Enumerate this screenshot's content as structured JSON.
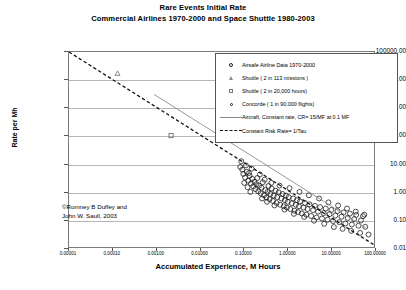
{
  "chart_data": {
    "type": "scatter",
    "title": "Rare Events Initial Rate",
    "subtitle": "Commercial Airlines 1970-2000 and Space Shuttle 1980-2003",
    "xlabel": "Accumulated Experience, M Hours",
    "ylabel": "Rate per Mh",
    "xscale": "log",
    "yscale": "log",
    "xlim": [
      1e-05,
      100.0
    ],
    "ylim": [
      0.01,
      100000.0
    ],
    "grid": "horizontal",
    "legend_position": "top-right",
    "xticks": [
      "0.00001",
      "0.00010",
      "0.00100",
      "0.01000",
      "0.10000",
      "1.00000",
      "10.00000",
      "100.00000"
    ],
    "xtick_values": [
      1e-05,
      0.0001,
      0.001,
      0.01,
      0.1,
      1,
      10,
      100
    ],
    "yticks": [
      "100000.00",
      "10000.00",
      "1000.00",
      "100.00",
      "10.00",
      "1.00",
      "0.10",
      "0.01"
    ],
    "ytick_values": [
      100000,
      10000,
      1000,
      100,
      10,
      1,
      0.1,
      0.01
    ],
    "credit": [
      "©Romney B Duffey and",
      "John W. Saull, 2003"
    ],
    "series": [
      {
        "name": "Airsafe Airline Data 1970-2000",
        "marker": "open-circle",
        "type": "scatter",
        "points": [
          [
            0.085,
            7.5
          ],
          [
            0.1,
            4.2
          ],
          [
            0.11,
            3.1
          ],
          [
            0.12,
            5.0
          ],
          [
            0.13,
            2.4
          ],
          [
            0.14,
            3.6
          ],
          [
            0.15,
            1.9
          ],
          [
            0.16,
            2.8
          ],
          [
            0.17,
            1.5
          ],
          [
            0.18,
            2.2
          ],
          [
            0.19,
            1.2
          ],
          [
            0.2,
            1.8
          ],
          [
            0.21,
            3.0
          ],
          [
            0.22,
            1.0
          ],
          [
            0.23,
            1.6
          ],
          [
            0.25,
            0.85
          ],
          [
            0.26,
            1.35
          ],
          [
            0.28,
            2.1
          ],
          [
            0.3,
            0.72
          ],
          [
            0.32,
            1.1
          ],
          [
            0.34,
            0.6
          ],
          [
            0.36,
            0.95
          ],
          [
            0.38,
            1.55
          ],
          [
            0.4,
            0.52
          ],
          [
            0.42,
            0.8
          ],
          [
            0.45,
            1.25
          ],
          [
            0.48,
            0.45
          ],
          [
            0.5,
            0.7
          ],
          [
            0.55,
            1.05
          ],
          [
            0.58,
            0.38
          ],
          [
            0.6,
            0.62
          ],
          [
            0.65,
            0.92
          ],
          [
            0.7,
            0.33
          ],
          [
            0.75,
            0.55
          ],
          [
            0.8,
            0.8
          ],
          [
            0.85,
            0.29
          ],
          [
            0.9,
            0.48
          ],
          [
            0.95,
            0.7
          ],
          [
            1.0,
            0.26
          ],
          [
            1.05,
            0.42
          ],
          [
            1.1,
            0.62
          ],
          [
            1.2,
            0.23
          ],
          [
            1.3,
            0.37
          ],
          [
            1.4,
            0.55
          ],
          [
            1.5,
            0.2
          ],
          [
            1.6,
            0.33
          ],
          [
            1.7,
            0.48
          ],
          [
            1.8,
            0.18
          ],
          [
            1.9,
            0.29
          ],
          [
            2.0,
            0.43
          ],
          [
            2.2,
            0.16
          ],
          [
            2.4,
            0.26
          ],
          [
            2.6,
            0.38
          ],
          [
            2.8,
            0.145
          ],
          [
            3.0,
            0.23
          ],
          [
            3.3,
            0.34
          ],
          [
            3.6,
            0.13
          ],
          [
            4.0,
            0.21
          ],
          [
            4.4,
            0.3
          ],
          [
            4.8,
            0.115
          ],
          [
            5.2,
            0.185
          ],
          [
            5.8,
            0.27
          ],
          [
            6.4,
            0.105
          ],
          [
            7.0,
            0.165
          ],
          [
            7.8,
            0.24
          ],
          [
            8.6,
            0.095
          ],
          [
            9.5,
            0.15
          ],
          [
            10.5,
            0.215
          ],
          [
            11.5,
            0.085
          ],
          [
            13.0,
            0.135
          ],
          [
            14.5,
            0.195
          ],
          [
            16.0,
            0.078
          ],
          [
            18.0,
            0.122
          ],
          [
            20.0,
            0.175
          ],
          [
            22.0,
            0.07
          ],
          [
            25.0,
            0.11
          ],
          [
            28.0,
            0.158
          ],
          [
            31.0,
            0.064
          ],
          [
            35.0,
            0.1
          ],
          [
            39.0,
            0.142
          ],
          [
            44.0,
            0.058
          ],
          [
            50.0,
            0.09
          ],
          [
            56.0,
            0.128
          ],
          [
            63.0,
            0.053
          ],
          [
            0.09,
            12.0
          ],
          [
            0.095,
            6.0
          ],
          [
            0.105,
            2.0
          ],
          [
            0.115,
            8.5
          ],
          [
            0.125,
            1.4
          ],
          [
            0.135,
            4.5
          ],
          [
            0.145,
            0.95
          ],
          [
            0.155,
            6.5
          ],
          [
            0.24,
            4.0
          ],
          [
            0.27,
            0.55
          ],
          [
            0.31,
            2.6
          ],
          [
            0.35,
            0.42
          ],
          [
            0.44,
            2.0
          ],
          [
            0.52,
            0.31
          ],
          [
            0.68,
            1.6
          ],
          [
            0.88,
            0.22
          ],
          [
            1.15,
            1.3
          ],
          [
            1.45,
            0.155
          ],
          [
            1.95,
            0.95
          ],
          [
            2.5,
            0.12
          ],
          [
            3.2,
            0.72
          ],
          [
            4.2,
            0.088
          ],
          [
            5.5,
            0.55
          ],
          [
            7.2,
            0.068
          ],
          [
            9.0,
            0.4
          ],
          [
            12.0,
            0.052
          ],
          [
            15.0,
            0.31
          ],
          [
            19.0,
            0.045
          ],
          [
            24.0,
            0.24
          ],
          [
            30.0,
            0.038
          ],
          [
            38.0,
            0.185
          ],
          [
            48.0,
            0.032
          ],
          [
            60.0,
            0.145
          ],
          [
            75.0,
            0.028
          ]
        ]
      },
      {
        "name": "Shuttle ( 2 in 113 missions )",
        "marker": "open-triangle",
        "type": "scatter",
        "points": [
          [
            0.00013,
            17000
          ]
        ]
      },
      {
        "name": "Shuttle ( 2 in 20,000 hours)",
        "marker": "open-square",
        "type": "scatter",
        "points": [
          [
            0.0022,
            100
          ]
        ]
      },
      {
        "name": "Concorde ( 1 in 90,000 flights)",
        "marker": "open-circle-small",
        "type": "scatter",
        "points": []
      },
      {
        "name": "Aircraft, Constant rate, CR= 15/MF at 0.1 MF",
        "marker": "solid-line",
        "type": "line",
        "points": [
          [
            0.0009,
            3000
          ],
          [
            70.0,
            0.045
          ]
        ]
      },
      {
        "name": "Constant Risk  Rate= 1/Tau",
        "marker": "dashed-line",
        "type": "line",
        "points": [
          [
            1e-05,
            100000
          ],
          [
            100.0,
            0.012
          ]
        ]
      }
    ]
  },
  "legend": {
    "items": [
      {
        "key": "open-circle",
        "label": "Airsafe Airline Data 1970-2000"
      },
      {
        "key": "open-triangle",
        "label": "Shuttle ( 2 in 113 missions )"
      },
      {
        "key": "open-square",
        "label": "Shuttle ( 2 in 20,000 hours)"
      },
      {
        "key": "open-circle-small",
        "label": "Concorde ( 1 in 90,000 flights)"
      },
      {
        "key": "solid-line",
        "label": "Aircraft, Constant rate, CR= 15/MF at 0.1 MF"
      },
      {
        "key": "dashed-line",
        "label": "Constant Risk  Rate= 1/Tau"
      }
    ]
  },
  "credit": {
    "line1": "©Romney B Duffey and",
    "line2": "John W. Saull, 2003"
  }
}
